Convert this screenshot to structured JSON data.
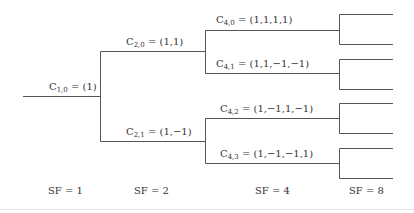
{
  "line_color": "#555555",
  "codes": [
    {
      "id": "c10",
      "name": "C",
      "sub": "1,0",
      "value": "= (1)"
    },
    {
      "id": "c20",
      "name": "C",
      "sub": "2,0",
      "value": "= (1,1)"
    },
    {
      "id": "c21",
      "name": "C",
      "sub": "2,1",
      "value": "= (1,−1)"
    },
    {
      "id": "c40",
      "name": "C",
      "sub": "4,0",
      "value": "= (1,1,1,1)"
    },
    {
      "id": "c41",
      "name": "C",
      "sub": "4,1",
      "value": "= (1,1,−1,−1)"
    },
    {
      "id": "c42",
      "name": "C",
      "sub": "4,2",
      "value": "= (1,−1,1,−1)"
    },
    {
      "id": "c43",
      "name": "C",
      "sub": "4,3",
      "value": "= (1,−1,−1,1)"
    }
  ],
  "spreading_factors": [
    {
      "label": "SF = 1"
    },
    {
      "label": "SF = 2"
    },
    {
      "label": "SF = 4"
    },
    {
      "label": "SF = 8"
    }
  ]
}
